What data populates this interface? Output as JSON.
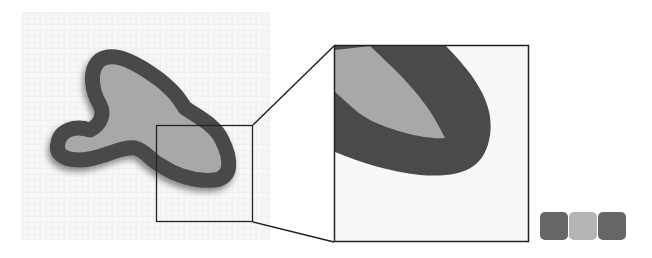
{
  "figure": {
    "colors": {
      "outline": "#4a4a4a",
      "fill": "#a8a8a8",
      "background": "#f7f7f7",
      "frame": "#222222"
    },
    "source_box": {
      "x": 156,
      "y": 125,
      "w": 97,
      "h": 97
    },
    "zoom_box": {
      "x": 334,
      "y": 45,
      "w": 195,
      "h": 197
    },
    "swatches": [
      {
        "name": "outline-color",
        "color": "#666666"
      },
      {
        "name": "fill-color",
        "color": "#b5b5b5"
      },
      {
        "name": "outline-color-2",
        "color": "#666666"
      }
    ]
  }
}
